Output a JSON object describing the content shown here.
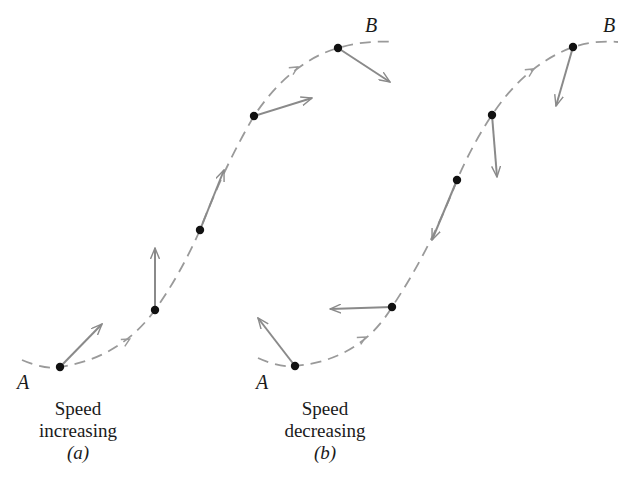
{
  "colors": {
    "path": "#9a9a9a",
    "vector": "#8a8a8a",
    "point": "#111111",
    "text": "#1a1a1a"
  },
  "panels": [
    {
      "id": "a",
      "caption_line1": "Speed",
      "caption_line2": "increasing",
      "caption_sub": "(a)",
      "start_label": "A",
      "end_label": "B",
      "path_d": "M 22 360 Q 45 370 60 367 Q 120 358 155 310 Q 180 275 200 230 Q 225 165 254 116 Q 290 62 338 48 Q 365 40 395 42",
      "path_direction_arrows": [
        {
          "x": 128,
          "y": 340,
          "angle": -30
        },
        {
          "x": 296,
          "y": 68,
          "angle": -32
        }
      ],
      "points": [
        {
          "x": 60,
          "y": 367
        },
        {
          "x": 155,
          "y": 310
        },
        {
          "x": 200,
          "y": 230
        },
        {
          "x": 254,
          "y": 116
        },
        {
          "x": 338,
          "y": 48
        }
      ],
      "vectors": [
        {
          "x1": 60,
          "y1": 367,
          "x2": 102,
          "y2": 324
        },
        {
          "x1": 155,
          "y1": 310,
          "x2": 155,
          "y2": 248
        },
        {
          "x1": 200,
          "y1": 230,
          "x2": 224,
          "y2": 170
        },
        {
          "x1": 254,
          "y1": 116,
          "x2": 312,
          "y2": 98
        },
        {
          "x1": 338,
          "y1": 48,
          "x2": 390,
          "y2": 82
        }
      ]
    },
    {
      "id": "b",
      "caption_line1": "Speed",
      "caption_line2": "decreasing",
      "caption_sub": "(b)",
      "start_label": "A",
      "end_label": "B",
      "path_d": "M 258 358 Q 280 368 295 366 Q 360 360 392 307 Q 430 250 457 180 Q 472 145 492 115 Q 525 65 573 47 Q 595 40 618 42",
      "path_direction_arrows": [
        {
          "x": 364,
          "y": 338,
          "angle": -30
        },
        {
          "x": 532,
          "y": 70,
          "angle": -32
        }
      ],
      "points": [
        {
          "x": 295,
          "y": 366
        },
        {
          "x": 392,
          "y": 307
        },
        {
          "x": 457,
          "y": 180
        },
        {
          "x": 492,
          "y": 115
        },
        {
          "x": 573,
          "y": 47
        }
      ],
      "vectors": [
        {
          "x1": 295,
          "y1": 366,
          "x2": 258,
          "y2": 318
        },
        {
          "x1": 392,
          "y1": 307,
          "x2": 330,
          "y2": 309
        },
        {
          "x1": 457,
          "y1": 180,
          "x2": 432,
          "y2": 240
        },
        {
          "x1": 492,
          "y1": 115,
          "x2": 497,
          "y2": 177
        },
        {
          "x1": 573,
          "y1": 47,
          "x2": 556,
          "y2": 106
        }
      ]
    }
  ]
}
